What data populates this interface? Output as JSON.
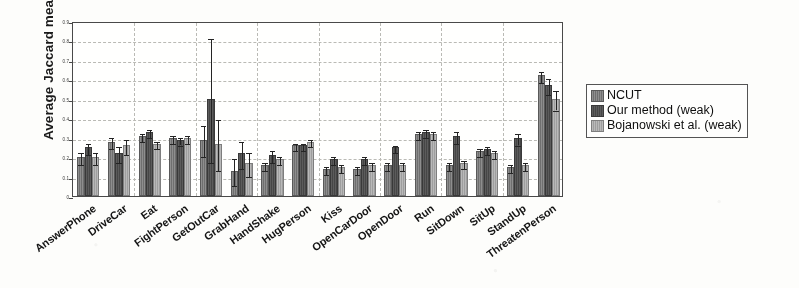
{
  "chart_data": {
    "type": "bar",
    "title": "",
    "xlabel": "",
    "ylabel": "Average Jaccard measure",
    "ylim": [
      0,
      0.9
    ],
    "yticks": [
      0,
      0.1,
      0.2,
      0.3,
      0.4,
      0.5,
      0.6,
      0.7,
      0.8,
      0.9
    ],
    "ytick_labels": [
      "0",
      "0.1",
      "0.2",
      "0.3",
      "0.4",
      "0.5",
      "0.6",
      "0.7",
      "0.8",
      "0.9"
    ],
    "grid": true,
    "legend_position": "right-outside",
    "orientation": "vertical-grouped",
    "error_bars": true,
    "categories": [
      "AnswerPhone",
      "DriveCar",
      "Eat",
      "FightPerson",
      "GetOutCar",
      "GrabHand",
      "HandShake",
      "HugPerson",
      "Kiss",
      "OpenCarDoor",
      "OpenDoor",
      "Run",
      "SitDown",
      "SitUp",
      "StandUp",
      "ThreatenPerson"
    ],
    "series": [
      {
        "name": "NCUT",
        "color": "#7e7e7e",
        "values": [
          0.2,
          0.28,
          0.31,
          0.3,
          0.29,
          0.13,
          0.16,
          0.26,
          0.14,
          0.14,
          0.16,
          0.32,
          0.16,
          0.23,
          0.15,
          0.62
        ],
        "errors": [
          0.03,
          0.03,
          0.02,
          0.02,
          0.08,
          0.07,
          0.02,
          0.02,
          0.02,
          0.02,
          0.02,
          0.02,
          0.02,
          0.02,
          0.02,
          0.03
        ]
      },
      {
        "name": "Our method (weak)",
        "color": "#4a4a4a",
        "values": [
          0.25,
          0.22,
          0.33,
          0.29,
          0.5,
          0.22,
          0.21,
          0.26,
          0.19,
          0.19,
          0.25,
          0.33,
          0.31,
          0.24,
          0.3,
          0.57
        ],
        "errors": [
          0.03,
          0.04,
          0.02,
          0.02,
          0.32,
          0.07,
          0.03,
          0.02,
          0.02,
          0.02,
          0.02,
          0.02,
          0.03,
          0.02,
          0.03,
          0.04
        ]
      },
      {
        "name": "Bojanowski et al. (weak)",
        "color": "#acacac",
        "values": [
          0.2,
          0.26,
          0.27,
          0.3,
          0.27,
          0.17,
          0.19,
          0.28,
          0.15,
          0.16,
          0.16,
          0.32,
          0.17,
          0.22,
          0.16,
          0.5
        ],
        "errors": [
          0.03,
          0.04,
          0.02,
          0.02,
          0.13,
          0.06,
          0.02,
          0.02,
          0.02,
          0.02,
          0.02,
          0.02,
          0.02,
          0.02,
          0.02,
          0.05
        ]
      }
    ]
  }
}
